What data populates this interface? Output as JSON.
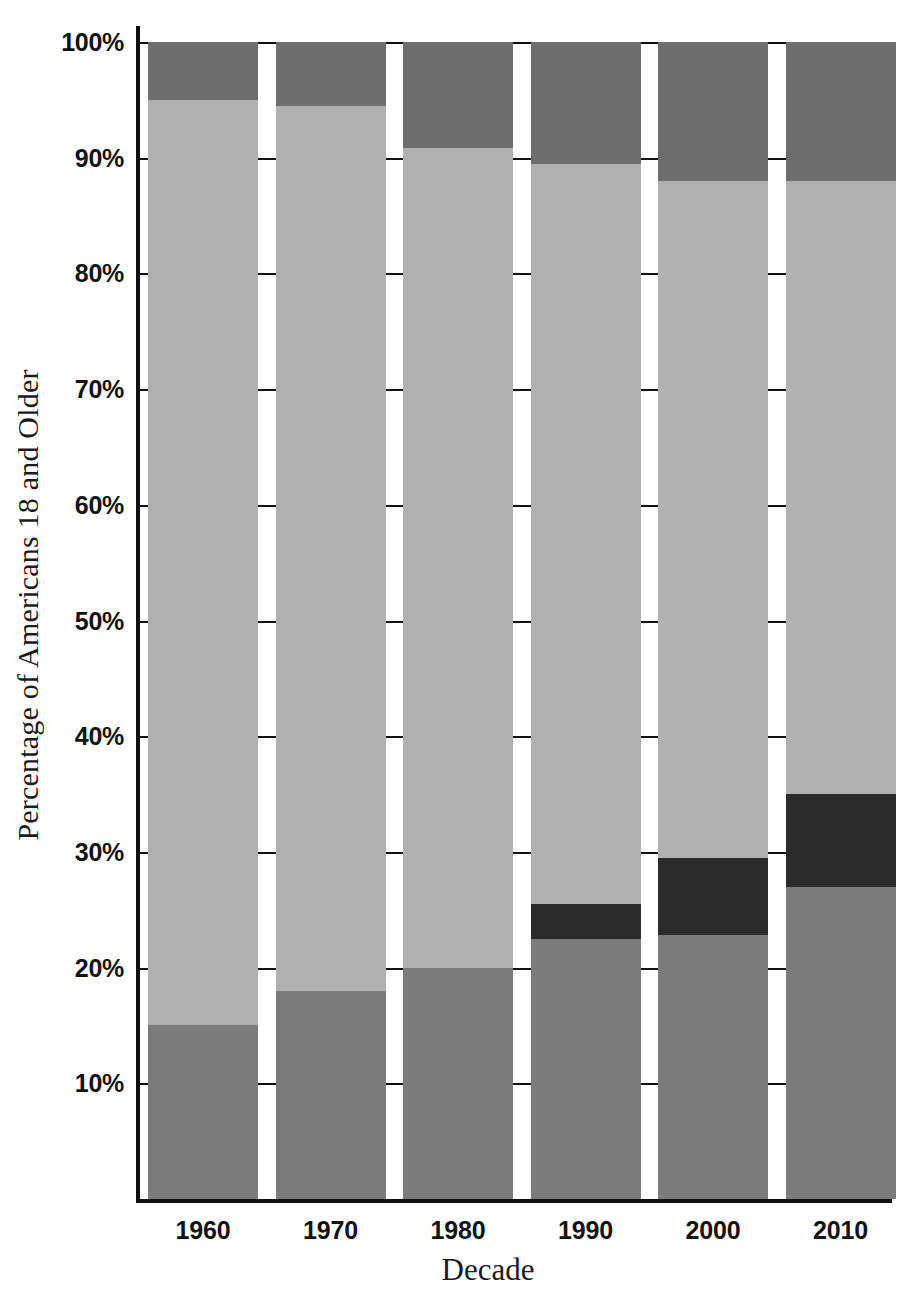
{
  "chart_data": {
    "type": "bar",
    "subtype": "stacked-bar",
    "title": "",
    "xlabel": "Decade",
    "ylabel": "Percentage of Americans 18 and Older",
    "categories": [
      "1960",
      "1970",
      "1980",
      "1990",
      "2000",
      "2010"
    ],
    "ytick_labels": [
      "100%",
      "90%",
      "80%",
      "70%",
      "60%",
      "50%",
      "40%",
      "30%",
      "20%",
      "10%"
    ],
    "ytick_values": [
      100,
      90,
      80,
      70,
      60,
      50,
      40,
      30,
      20,
      10
    ],
    "ylim": [
      0,
      100
    ],
    "ylim_labels": [
      "0%",
      "100%"
    ],
    "grid": true,
    "grid_axis": "y",
    "legend": false,
    "legend_position": "none",
    "stack_order": "bottom-to-top",
    "series": [
      {
        "name": "segment-1-bottom",
        "color": "#7b7b7b",
        "values": [
          15.0,
          18.0,
          20.0,
          22.5,
          22.8,
          27.0
        ]
      },
      {
        "name": "segment-2-dark",
        "color": "#2b2b2b",
        "values": [
          0.0,
          0.0,
          0.0,
          3.0,
          6.7,
          8.0
        ]
      },
      {
        "name": "segment-3-light",
        "color": "#b0b0b0",
        "values": [
          80.0,
          76.5,
          70.8,
          64.0,
          58.5,
          53.0
        ]
      },
      {
        "name": "segment-4-top",
        "color": "#6e6e6e",
        "values": [
          5.0,
          5.5,
          9.2,
          10.5,
          12.0,
          12.0
        ]
      }
    ],
    "cumulative_tops": [
      [
        15.0,
        15.0,
        95.0,
        100.0
      ],
      [
        18.0,
        18.0,
        94.5,
        100.0
      ],
      [
        20.0,
        20.0,
        90.8,
        100.0
      ],
      [
        22.5,
        25.5,
        89.5,
        100.0
      ],
      [
        22.8,
        29.5,
        88.0,
        100.0
      ],
      [
        27.0,
        35.0,
        88.0,
        100.0
      ]
    ]
  },
  "axes": {
    "y_title": "Percentage of Americans 18 and Older",
    "x_title": "Decade"
  },
  "colors": {
    "background": "#ffffff",
    "axis": "#111111",
    "grid": "#111111",
    "text": "#111111",
    "segment_bottom": "#7b7b7b",
    "segment_dark": "#2b2b2b",
    "segment_light": "#b0b0b0",
    "segment_top": "#6e6e6e"
  }
}
